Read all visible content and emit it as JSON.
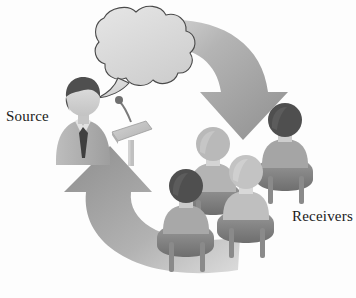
{
  "diagram": {
    "type": "illustration",
    "background_color": "#fdfdfd"
  },
  "labels": {
    "source": "Source",
    "receivers": "Receivers"
  },
  "colors": {
    "arrow_dark": "#8c8c8c",
    "arrow_mid": "#a3a3a3",
    "arrow_light": "#c9c9c9",
    "arrow_pale": "#e2e2e2",
    "bubble_fill": "#dcdcdc",
    "bubble_outline": "#4a4a4a",
    "hair_dark": "#4f4f4f",
    "hair_light": "#b9b9b9",
    "skin": "#d6d6d6",
    "suit": "#b0b0b0",
    "tie_dark": "#3f3f3f",
    "chair_mid": "#8f8f8f",
    "chair_dark": "#6f6f6f",
    "podium": "#c4c4c4",
    "text": "#1a1a1a"
  },
  "elements": {
    "speech_bubble": "speech-bubble",
    "speaker": "speaker-figure",
    "podium": "podium",
    "microphone": "microphone",
    "forward_arrow": "forward-arrow",
    "feedback_arrow": "feedback-arrow"
  },
  "audience": {
    "count": 4,
    "members": [
      {
        "id": "receiver-back-right",
        "hair": "dark"
      },
      {
        "id": "receiver-mid-left",
        "hair": "light"
      },
      {
        "id": "receiver-front-center",
        "hair": "light"
      },
      {
        "id": "receiver-front-left",
        "hair": "dark"
      }
    ]
  }
}
